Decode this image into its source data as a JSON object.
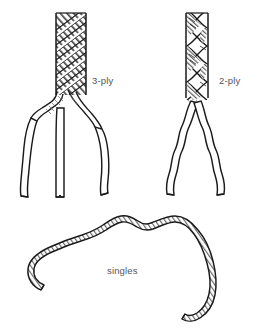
{
  "diagram": {
    "background_color": "#ffffff",
    "stroke_color": "#1a1a1a",
    "fill_color": "#ffffff",
    "hatch_color": "#4a4a4a",
    "label_color": "#555555",
    "labels": {
      "three_ply": "3-ply",
      "two_ply": "2-ply",
      "singles": "singles"
    },
    "label_positions": {
      "three_ply": {
        "x": 92,
        "y": 84
      },
      "two_ply": {
        "x": 219,
        "y": 84
      },
      "singles": {
        "x": 107,
        "y": 274
      }
    },
    "figures": [
      {
        "name": "three-ply-rope",
        "label": "3-ply",
        "ply_count": 3,
        "description": "Rope of three twisted strands, unravelling into three separate strands at the bottom"
      },
      {
        "name": "two-ply-rope",
        "label": "2-ply",
        "ply_count": 2,
        "description": "Rope of two twisted strands, unravelling into two separate strands at the bottom"
      },
      {
        "name": "singles-yarn",
        "label": "singles",
        "ply_count": 1,
        "description": "A single length of spun yarn laid in a wavy arc"
      }
    ]
  }
}
